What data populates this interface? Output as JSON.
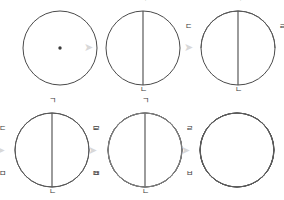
{
  "figure": {
    "type": "geometric-construction-diagram",
    "background_color": "#ffffff",
    "stroke_color": "#4a4a4a",
    "arrow_color": "#d8d8d8",
    "label_color": "#3a3a3a",
    "arrow_glyph": "➤",
    "arrow_semantic_name": "right-arrow-icon",
    "steps_total": 6,
    "rows": 2,
    "columns": 3
  },
  "labels": {
    "giyeok": "ㄱ",
    "nieun": "ㄴ",
    "digeut": "ㄷ",
    "rieul": "ㄹ",
    "mieum": "ㅁ",
    "bieup": "ㅂ"
  },
  "steps": [
    {
      "index": 1,
      "name": "circle-with-center",
      "description": "Base circle with marked center point",
      "radius": 37,
      "center": [
        60,
        48
      ],
      "point_labels": []
    },
    {
      "index": 2,
      "name": "circle-with-vertical-diameter",
      "description": "Vertical diameter drawn from top point to bottom point",
      "radius": 37,
      "center": [
        143,
        48
      ],
      "point_labels": [
        "ㄱ",
        "ㄴ"
      ]
    },
    {
      "index": 3,
      "name": "circle-with-first-arc",
      "description": "First arc swung between left and right points",
      "radius": 37,
      "center": [
        238,
        48
      ],
      "point_labels": [
        "ㄱ",
        "ㄴ",
        "ㄷ",
        "ㄹ"
      ]
    },
    {
      "index": 4,
      "name": "circle-with-two-arcs",
      "description": "Second arc added forming a vertical lens",
      "radius": 37,
      "center": [
        52,
        150
      ],
      "point_labels": [
        "ㄱ",
        "ㄴ",
        "ㄷ",
        "ㄹ",
        "ㅁ",
        "ㅂ"
      ]
    },
    {
      "index": 5,
      "name": "rosette-with-labels",
      "description": "All six arcs completed forming six petals, labels still shown",
      "radius": 37,
      "center": [
        145,
        150
      ],
      "point_labels": [
        "ㄱ",
        "ㄴ",
        "ㄷ",
        "ㄹ",
        "ㅁ",
        "ㅂ"
      ]
    },
    {
      "index": 6,
      "name": "finished-rosette",
      "description": "Finished six-petal rosette with labels removed",
      "radius": 37,
      "center": [
        237,
        150
      ],
      "point_labels": []
    }
  ],
  "arrows": [
    {
      "name": "arrow-step1-to-step2",
      "x": 86,
      "y": 43
    },
    {
      "name": "arrow-step2-to-step3",
      "x": 186,
      "y": 43
    },
    {
      "name": "arrow-rowbreak-to-step4",
      "x": -3,
      "y": 146
    },
    {
      "name": "arrow-step4-to-step5",
      "x": 90,
      "y": 146
    },
    {
      "name": "arrow-step5-to-step6",
      "x": 184,
      "y": 146
    }
  ]
}
